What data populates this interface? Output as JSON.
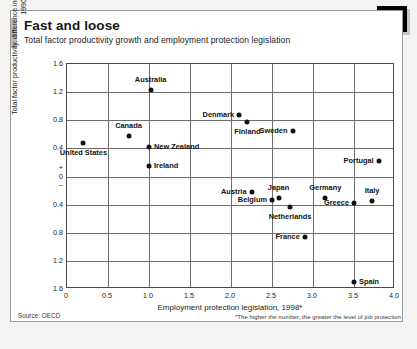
{
  "badge": {
    "number": "16"
  },
  "header": {
    "title": "Fast and loose",
    "subtitle": "Total factor productivity growth and employment protection legislation"
  },
  "footer": {
    "source": "Source: OECD",
    "footnote": "*The higher the number, the greater the level of job protection"
  },
  "chart_data": {
    "type": "scatter",
    "title": "Fast and loose",
    "subtitle": "Total factor productivity growth and employment protection legislation",
    "xlabel": "Employment protection legislation, 1998*",
    "ylabel": "Total factor productivity, difference in growth rates between 1980–90 and 1990–98",
    "xlim": [
      0,
      4.0
    ],
    "ylim": [
      -1.6,
      1.6
    ],
    "xticks": [
      "0",
      "0.5",
      "1.0",
      "1.5",
      "2.0",
      "2.5",
      "3.0",
      "3.5",
      "4.0"
    ],
    "xtick_values": [
      0,
      0.5,
      1.0,
      1.5,
      2.0,
      2.5,
      3.0,
      3.5,
      4.0
    ],
    "yticks": [
      "1.6",
      "1.2",
      "0.8",
      "0.4",
      "+",
      "0",
      "–",
      "0.4",
      "0.8",
      "1.2",
      "1.6"
    ],
    "ytick_values": [
      1.6,
      1.2,
      0.8,
      0.4,
      0.12,
      0,
      -0.12,
      -0.4,
      -0.8,
      -1.2,
      -1.6
    ],
    "grid": true,
    "legend": "none",
    "marker_color": "#111111",
    "points": [
      {
        "name": "United States",
        "x": 0.2,
        "y": 0.48,
        "label_pos": "below"
      },
      {
        "name": "Canada",
        "x": 0.75,
        "y": 0.58,
        "label_pos": "above"
      },
      {
        "name": "Australia",
        "x": 1.02,
        "y": 1.23,
        "label_pos": "above"
      },
      {
        "name": "New Zealand",
        "x": 1.0,
        "y": 0.42,
        "label_pos": "right"
      },
      {
        "name": "Ireland",
        "x": 1.0,
        "y": 0.15,
        "label_pos": "right"
      },
      {
        "name": "Denmark",
        "x": 2.1,
        "y": 0.88,
        "label_pos": "left"
      },
      {
        "name": "Finland",
        "x": 2.2,
        "y": 0.78,
        "label_pos": "below"
      },
      {
        "name": "Sweden",
        "x": 2.75,
        "y": 0.65,
        "label_pos": "left"
      },
      {
        "name": "Portugal",
        "x": 3.8,
        "y": 0.22,
        "label_pos": "left"
      },
      {
        "name": "Austria",
        "x": 2.25,
        "y": -0.22,
        "label_pos": "left"
      },
      {
        "name": "Germany",
        "x": 3.15,
        "y": -0.3,
        "label_pos": "above"
      },
      {
        "name": "Greece",
        "x": 3.5,
        "y": -0.37,
        "label_pos": "left"
      },
      {
        "name": "Italy",
        "x": 3.72,
        "y": -0.35,
        "label_pos": "above"
      },
      {
        "name": "Belgium",
        "x": 2.5,
        "y": -0.34,
        "label_pos": "left"
      },
      {
        "name": "Japan",
        "x": 2.58,
        "y": -0.31,
        "label_pos": "above"
      },
      {
        "name": "Netherlands",
        "x": 2.72,
        "y": -0.44,
        "label_pos": "below"
      },
      {
        "name": "France",
        "x": 2.9,
        "y": -0.86,
        "label_pos": "left"
      },
      {
        "name": "Spain",
        "x": 3.5,
        "y": -1.5,
        "label_pos": "right"
      }
    ]
  }
}
